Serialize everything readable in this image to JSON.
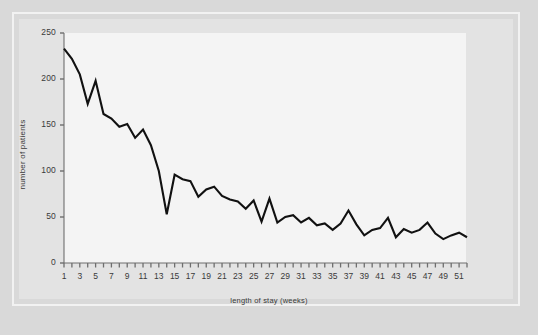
{
  "figure": {
    "background_color": "#d9d9d9",
    "panel_color": "#e3e3e3",
    "plot_color": "#f4f4f4",
    "frame_color": "#f2f2f2",
    "line_color": "#111111"
  },
  "chart_data": {
    "type": "line",
    "title": "",
    "subtitle": "",
    "xlabel": "length of stay (weeks)",
    "ylabel": "number of patients",
    "xlim": [
      1,
      52
    ],
    "ylim": [
      0,
      250
    ],
    "grid": false,
    "legend": null,
    "y_ticks": [
      0,
      50,
      100,
      150,
      200,
      250
    ],
    "y_tick_labels": [
      "0",
      "50",
      "100",
      "150",
      "200",
      "250"
    ],
    "x_ticks": [
      1,
      2,
      3,
      4,
      5,
      6,
      7,
      8,
      9,
      10,
      11,
      12,
      13,
      14,
      15,
      16,
      17,
      18,
      19,
      20,
      21,
      22,
      23,
      24,
      25,
      26,
      27,
      28,
      29,
      30,
      31,
      32,
      33,
      34,
      35,
      36,
      37,
      38,
      39,
      40,
      41,
      42,
      43,
      44,
      45,
      46,
      47,
      48,
      49,
      50,
      51,
      52
    ],
    "x_tick_labels": [
      "1",
      "",
      "3",
      "",
      "5",
      "",
      "7",
      "",
      "9",
      "",
      "11",
      "",
      "13",
      "",
      "15",
      "",
      "17",
      "",
      "19",
      "",
      "21",
      "",
      "23",
      "",
      "25",
      "",
      "27",
      "",
      "29",
      "",
      "31",
      "",
      "33",
      "",
      "35",
      "",
      "37",
      "",
      "39",
      "",
      "41",
      "",
      "43",
      "",
      "45",
      "",
      "47",
      "",
      "49",
      "",
      "51",
      ""
    ],
    "x": [
      1,
      2,
      3,
      4,
      5,
      6,
      7,
      8,
      9,
      10,
      11,
      12,
      13,
      14,
      15,
      16,
      17,
      18,
      19,
      20,
      21,
      22,
      23,
      24,
      25,
      26,
      27,
      28,
      29,
      30,
      31,
      32,
      33,
      34,
      35,
      36,
      37,
      38,
      39,
      40,
      41,
      42,
      43,
      44,
      45,
      46,
      47,
      48,
      49,
      50,
      51,
      52
    ],
    "values": [
      233,
      222,
      205,
      173,
      198,
      162,
      157,
      148,
      151,
      136,
      145,
      128,
      100,
      53,
      96,
      91,
      89,
      72,
      80,
      83,
      73,
      69,
      67,
      59,
      68,
      45,
      70,
      44,
      50,
      52,
      44,
      49,
      41,
      43,
      36,
      43,
      57,
      42,
      30,
      36,
      38,
      49,
      28,
      37,
      33,
      36,
      44,
      32,
      26,
      30,
      33,
      28
    ],
    "series": [
      {
        "name": "number of patients",
        "values": [
          233,
          222,
          205,
          173,
          198,
          162,
          157,
          148,
          151,
          136,
          145,
          128,
          100,
          53,
          96,
          91,
          89,
          72,
          80,
          83,
          73,
          69,
          67,
          59,
          68,
          45,
          70,
          44,
          50,
          52,
          44,
          49,
          41,
          43,
          36,
          43,
          57,
          42,
          30,
          36,
          38,
          49,
          28,
          37,
          33,
          36,
          44,
          32,
          26,
          30,
          33,
          28
        ]
      }
    ]
  }
}
